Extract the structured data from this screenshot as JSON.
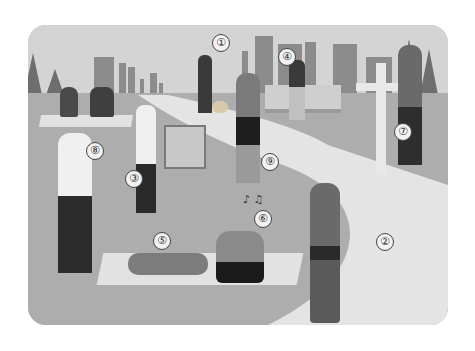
{
  "scene": {
    "description": "Park illustration with numbered people doing activities",
    "colors": {
      "sky": "#d4d4d4",
      "ground": "#adadad",
      "path": "#e4e4e4",
      "buildings": "#8c8c8c",
      "trees": "#6e6e6e"
    }
  },
  "labels": [
    {
      "num": "①",
      "activity": "man walking dog"
    },
    {
      "num": "②",
      "activity": "woman jogging"
    },
    {
      "num": "③",
      "activity": "man painting at easel"
    },
    {
      "num": "④",
      "activity": "boy reading on bench"
    },
    {
      "num": "⑤",
      "activity": "woman lying on mat"
    },
    {
      "num": "⑥",
      "activity": "man listening to music"
    },
    {
      "num": "⑦",
      "activity": "man drinking from fountain"
    },
    {
      "num": "⑧",
      "activity": "man taking selfie"
    },
    {
      "num": "⑨",
      "activity": "woman talking on phone"
    }
  ],
  "music_notes": "♪ ♫"
}
